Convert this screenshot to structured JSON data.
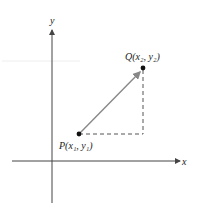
{
  "axes": {
    "x_label": "x",
    "y_label": "y"
  },
  "points": {
    "P": {
      "name": "P",
      "label": "P(x₁, y₁)"
    },
    "Q": {
      "name": "Q",
      "label": "Q(x₂, y₂)"
    }
  },
  "colors": {
    "axis": "#444444",
    "vector": "#888888",
    "dashed": "#555555",
    "point": "#111111"
  }
}
